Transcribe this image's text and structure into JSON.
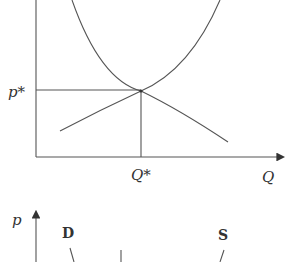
{
  "top_chart": {
    "type": "supply-demand diagram",
    "y_label_value": "p*",
    "x_label_value": "Q*",
    "x_axis_label": "Q",
    "curves": [
      "demand",
      "supply"
    ],
    "equilibrium": {
      "price": "p*",
      "quantity": "Q*"
    }
  },
  "bottom_chart": {
    "y_axis_label": "p",
    "demand_label": "D",
    "supply_label": "S"
  },
  "colors": {
    "line": "#555555",
    "background": "#ffffff"
  }
}
